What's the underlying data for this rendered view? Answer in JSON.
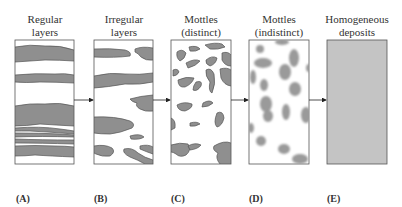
{
  "panels": [
    {
      "id": "A",
      "title_line1": "Regular",
      "title_line2": "layers",
      "label": "(A)"
    },
    {
      "id": "B",
      "title_line1": "Irregular",
      "title_line2": "layers",
      "label": "(B)"
    },
    {
      "id": "C",
      "title_line1": "Mottles",
      "title_line2": "(distinct)",
      "label": "(C)"
    },
    {
      "id": "D",
      "title_line1": "Mottles",
      "title_line2": "(indistinct)",
      "label": "(D)"
    },
    {
      "id": "E",
      "title_line1": "Homogeneous",
      "title_line2": "deposits",
      "label": "(E)"
    }
  ],
  "colors": {
    "fill": "#8f8f8f",
    "fill_soft": "#9a9a9a",
    "homogeneous": "#c4c4c4",
    "outline": "#555555",
    "arrow": "#222222"
  }
}
